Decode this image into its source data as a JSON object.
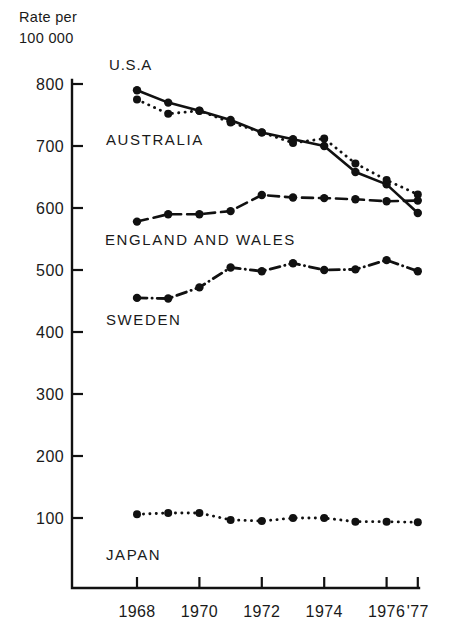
{
  "chart_data": {
    "type": "line",
    "title": "",
    "ylabel": "Rate per 100 000",
    "ylabel_line1": "Rate per",
    "ylabel_line2": "100 000",
    "xlabel": "",
    "x": [
      1968,
      1969,
      1970,
      1971,
      1972,
      1973,
      1974,
      1975,
      1976,
      1977
    ],
    "xtick_labels": [
      "1968",
      "1970",
      "1972",
      "1974",
      "1976",
      "'77"
    ],
    "xtick_values": [
      1968,
      1970,
      1972,
      1974,
      1976,
      1977
    ],
    "ytick_labels": [
      "800",
      "700",
      "600",
      "500",
      "400",
      "300",
      "200",
      "100"
    ],
    "ytick_values": [
      800,
      700,
      600,
      500,
      400,
      300,
      200,
      100
    ],
    "ylim": [
      40,
      830
    ],
    "xlim": [
      1967.6,
      1977.3
    ],
    "grid": false,
    "legend_position": "inline-annotations",
    "series": [
      {
        "name": "U.S.A",
        "label": "U.S.A",
        "style": "solid",
        "color": "#111111",
        "values": [
          790,
          770,
          757,
          742,
          722,
          711,
          700,
          658,
          638,
          592
        ]
      },
      {
        "name": "AUSTRALIA",
        "label": "AUSTRALIA",
        "style": "dotted",
        "color": "#111111",
        "values": [
          775,
          752,
          757,
          738,
          722,
          705,
          712,
          672,
          645,
          622
        ]
      },
      {
        "name": "ENGLAND AND WALES",
        "label": "ENGLAND AND WALES",
        "style": "dashed",
        "color": "#111111",
        "values": [
          578,
          590,
          590,
          595,
          621,
          617,
          616,
          614,
          611,
          612
        ]
      },
      {
        "name": "SWEDEN",
        "label": "SWEDEN",
        "style": "dash-dot",
        "color": "#111111",
        "values": [
          455,
          454,
          472,
          504,
          498,
          511,
          500,
          501,
          516,
          498
        ]
      },
      {
        "name": "JAPAN",
        "label": "JAPAN",
        "style": "dotted",
        "color": "#111111",
        "values": [
          106,
          108,
          108,
          97,
          95,
          100,
          100,
          94,
          94,
          93
        ]
      }
    ],
    "annotations": [
      {
        "text": "U.S.A",
        "x_px": 109,
        "y_px": 70,
        "for_series": "U.S.A"
      },
      {
        "text": "AUSTRALIA",
        "x_px": 106,
        "y_px": 145,
        "for_series": "AUSTRALIA"
      },
      {
        "text": "ENGLAND AND WALES",
        "x_px": 105,
        "y_px": 245,
        "for_series": "ENGLAND AND WALES"
      },
      {
        "text": "SWEDEN",
        "x_px": 106,
        "y_px": 325,
        "for_series": "SWEDEN"
      },
      {
        "text": "JAPAN",
        "x_px": 106,
        "y_px": 560,
        "for_series": "JAPAN"
      }
    ]
  }
}
